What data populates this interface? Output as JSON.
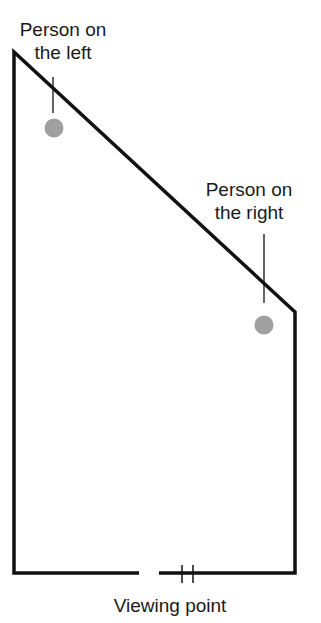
{
  "diagram": {
    "labels": {
      "person_left": {
        "line1": "Person on",
        "line2": "the left"
      },
      "person_right": {
        "line1": "Person on",
        "line2": "the right"
      },
      "viewing_point": "Viewing point"
    },
    "colors": {
      "wall": "#111111",
      "person": "#a0a0a0",
      "text": "#1a1a1a"
    }
  }
}
